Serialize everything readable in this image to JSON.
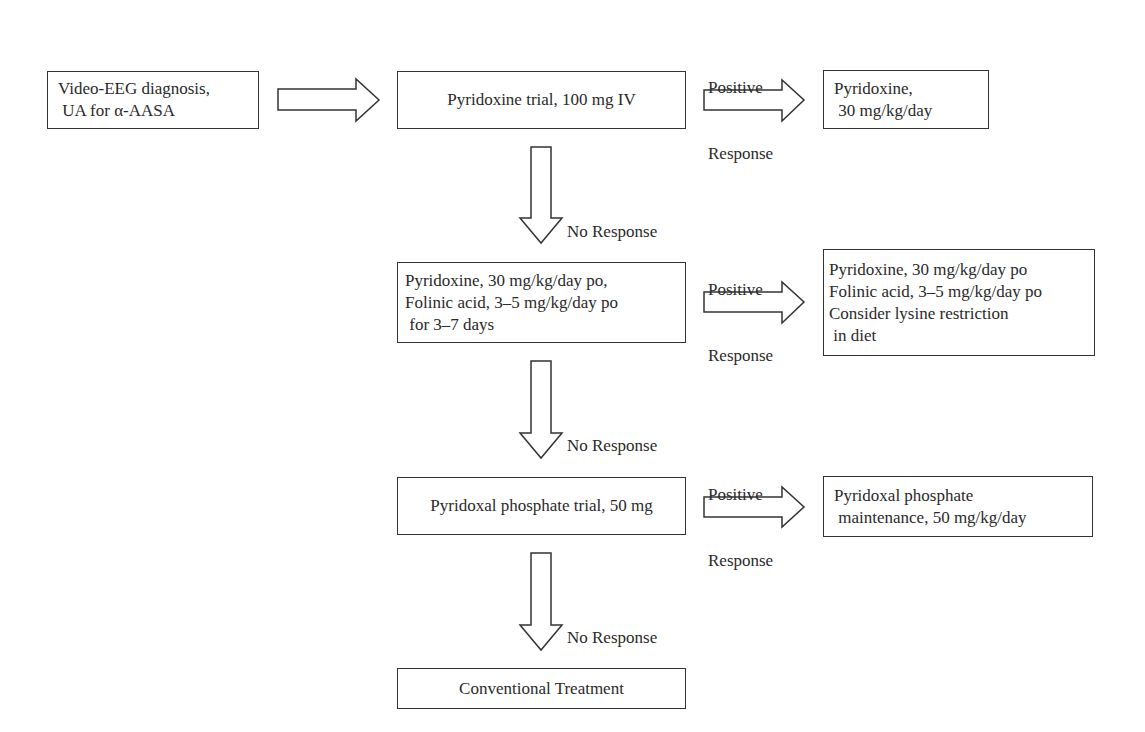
{
  "diagram": {
    "type": "flowchart",
    "nodes": {
      "start": {
        "lines": [
          "Video-EEG diagnosis,",
          " UA for α-AASA"
        ]
      },
      "pyridoxine_trial": {
        "lines": [
          "Pyridoxine trial, 100 mg IV"
        ]
      },
      "pyridoxine_maint": {
        "lines": [
          "Pyridoxine,",
          " 30 mg/kg/day"
        ]
      },
      "pyridoxine_folinic_trial": {
        "lines": [
          "Pyridoxine, 30 mg/kg/day po,",
          "Folinic acid, 3–5 mg/kg/day po",
          " for 3–7 days"
        ]
      },
      "pyridoxine_folinic_maint": {
        "lines": [
          "Pyridoxine, 30 mg/kg/day po",
          "Folinic acid, 3–5 mg/kg/day po",
          "Consider lysine restriction",
          " in diet"
        ]
      },
      "plp_trial": {
        "lines": [
          "Pyridoxal phosphate trial, 50 mg"
        ]
      },
      "plp_maint": {
        "lines": [
          "Pyridoxal phosphate",
          " maintenance, 50 mg/kg/day"
        ]
      },
      "conventional": {
        "lines": [
          "Conventional Treatment"
        ]
      }
    },
    "edge_labels": {
      "positive_1": [
        "Positive",
        "Response"
      ],
      "positive_2": [
        "Positive",
        "Response"
      ],
      "positive_3": [
        "Positive",
        "Response"
      ],
      "no_response_1": "No Response",
      "no_response_2": "No Response",
      "no_response_3": "No Response"
    },
    "edges": [
      {
        "from": "start",
        "to": "pyridoxine_trial",
        "label": ""
      },
      {
        "from": "pyridoxine_trial",
        "to": "pyridoxine_maint",
        "label": "Positive Response"
      },
      {
        "from": "pyridoxine_trial",
        "to": "pyridoxine_folinic_trial",
        "label": "No Response"
      },
      {
        "from": "pyridoxine_folinic_trial",
        "to": "pyridoxine_folinic_maint",
        "label": "Positive Response"
      },
      {
        "from": "pyridoxine_folinic_trial",
        "to": "plp_trial",
        "label": "No Response"
      },
      {
        "from": "plp_trial",
        "to": "plp_maint",
        "label": "Positive Response"
      },
      {
        "from": "plp_trial",
        "to": "conventional",
        "label": "No Response"
      }
    ]
  },
  "colors": {
    "stroke": "#333333",
    "text": "#2a2a2a",
    "background": "#ffffff"
  }
}
